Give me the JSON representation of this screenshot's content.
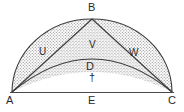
{
  "figure": {
    "type": "geometry-diagram",
    "canvas": {
      "width": 184,
      "height": 112
    },
    "colors": {
      "background": "#ffffff",
      "stroke": "#3a3a3a",
      "label": "#2b2b2b",
      "stipple": "#9a9a9a",
      "baseline": "#4a4a4a"
    },
    "vertices": [
      {
        "name": "A",
        "label": "A",
        "x": 12,
        "y": 92
      },
      {
        "name": "B",
        "label": "B",
        "x": 92,
        "y": 19
      },
      {
        "name": "C",
        "label": "C",
        "x": 172,
        "y": 92
      },
      {
        "name": "D",
        "label": "D",
        "x": 92,
        "y": 60
      },
      {
        "name": "E",
        "label": "E",
        "x": 92,
        "y": 92
      }
    ],
    "vertex_labels": [
      {
        "text": "A",
        "x": 6,
        "y": 95
      },
      {
        "text": "B",
        "x": 88,
        "y": 2
      },
      {
        "text": "C",
        "x": 168,
        "y": 95
      },
      {
        "text": "D",
        "x": 86,
        "y": 61
      },
      {
        "text": "E",
        "x": 88,
        "y": 95
      }
    ],
    "region_labels": [
      {
        "text": "U",
        "x": 39,
        "y": 47
      },
      {
        "text": "V",
        "x": 89,
        "y": 40
      },
      {
        "text": "W",
        "x": 129,
        "y": 48
      }
    ],
    "symbols": [
      {
        "name": "dagger",
        "text": "†",
        "x": 89,
        "y": 72
      }
    ],
    "strokes": {
      "outer_arc": "semicircular arc A to C through B",
      "inner_arc": "shallow arc A to C through D",
      "chord_ab": "line A to B",
      "chord_bc": "line B to C",
      "baseline_ac": "line A to C"
    }
  }
}
